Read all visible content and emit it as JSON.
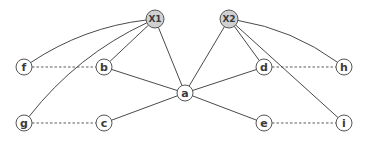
{
  "diagram": {
    "type": "graph",
    "colors": {
      "edge": "#4a4a4a",
      "node_stroke": "#555555",
      "node_fill": "#ffffff",
      "latent_fill": "#d0d0d0",
      "label": "#3a3a3a"
    },
    "nodes": [
      {
        "id": "X1",
        "label": "X1",
        "x": 155,
        "y": 19,
        "r": 9,
        "latent": true
      },
      {
        "id": "X2",
        "label": "X2",
        "x": 229,
        "y": 19,
        "r": 9,
        "latent": true
      },
      {
        "id": "f",
        "label": "f",
        "x": 24,
        "y": 67,
        "r": 8,
        "latent": false
      },
      {
        "id": "b",
        "label": "b",
        "x": 104,
        "y": 67,
        "r": 8,
        "latent": false
      },
      {
        "id": "a",
        "label": "a",
        "x": 185,
        "y": 93,
        "r": 8,
        "latent": false
      },
      {
        "id": "d",
        "label": "d",
        "x": 264,
        "y": 67,
        "r": 8,
        "latent": false
      },
      {
        "id": "h",
        "label": "h",
        "x": 344,
        "y": 67,
        "r": 8,
        "latent": false
      },
      {
        "id": "g",
        "label": "g",
        "x": 24,
        "y": 123,
        "r": 8,
        "latent": false
      },
      {
        "id": "c",
        "label": "c",
        "x": 104,
        "y": 123,
        "r": 8,
        "latent": false
      },
      {
        "id": "e",
        "label": "e",
        "x": 264,
        "y": 123,
        "r": 8,
        "latent": false
      },
      {
        "id": "i",
        "label": "i",
        "x": 344,
        "y": 123,
        "r": 8,
        "latent": false
      }
    ],
    "edges": [
      {
        "from": "X1",
        "to": "f",
        "style": "curve",
        "dashed": false
      },
      {
        "from": "X1",
        "to": "b",
        "style": "line",
        "dashed": false
      },
      {
        "from": "X1",
        "to": "a",
        "style": "line",
        "dashed": false
      },
      {
        "from": "X1",
        "to": "g",
        "style": "curve",
        "dashed": false
      },
      {
        "from": "X2",
        "to": "h",
        "style": "curve",
        "dashed": false
      },
      {
        "from": "X2",
        "to": "d",
        "style": "line",
        "dashed": false
      },
      {
        "from": "X2",
        "to": "a",
        "style": "line",
        "dashed": false
      },
      {
        "from": "X2",
        "to": "i",
        "style": "line",
        "dashed": false
      },
      {
        "from": "a",
        "to": "b",
        "style": "line",
        "dashed": false
      },
      {
        "from": "a",
        "to": "c",
        "style": "line",
        "dashed": false
      },
      {
        "from": "a",
        "to": "d",
        "style": "line",
        "dashed": false
      },
      {
        "from": "a",
        "to": "e",
        "style": "line",
        "dashed": false
      },
      {
        "from": "f",
        "to": "b",
        "style": "line",
        "dashed": true
      },
      {
        "from": "g",
        "to": "c",
        "style": "line",
        "dashed": true
      },
      {
        "from": "d",
        "to": "h",
        "style": "line",
        "dashed": true
      },
      {
        "from": "e",
        "to": "i",
        "style": "line",
        "dashed": true
      }
    ]
  }
}
